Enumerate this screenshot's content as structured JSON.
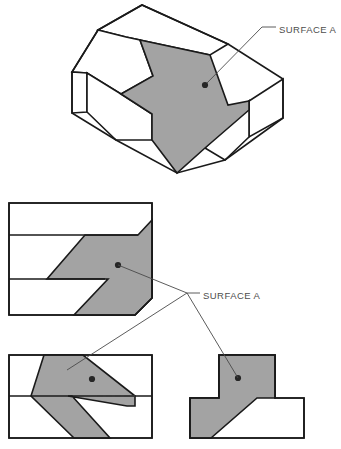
{
  "sheet": {
    "width": 341,
    "height": 449,
    "background": "#ffffff",
    "line_color": "#1a1a1a",
    "surface_fill": "#a3a3a3",
    "leader_color": "#4a4a4a",
    "text_color": "#4d4d4d"
  },
  "annotations": {
    "pictorial_label": "SURFACE A",
    "ortho_label": "SURFACE A"
  },
  "views": {
    "pictorial": {
      "name": "isometric-pictorial-view",
      "outline": "98,30 142,5 228,44 283,79 283,118 225,160 177,173 116,140 72,113 72,72",
      "top_rear_face": "98,30 142,5 228,44 210,55 140,40 126,37",
      "upper_top_face": "98,30 126,37 140,40 153,76 121,94 87,73 72,72",
      "step_left_face": "72,72 87,73 87,112 72,113",
      "step_front_face": "87,112 87,73 121,94 152,114 152,140 116,140",
      "right_side_face": "283,79 283,118 249,137 249,101",
      "lower_right_face": "249,101 249,137 225,160 205,148",
      "surface_a": "140,40 210,55 228,105 249,101 249,110 205,148 177,173 152,140 152,114 121,94 153,76",
      "surface_a_dot": {
        "x": 205,
        "y": 85
      }
    },
    "top_view": {
      "name": "top-orthographic-view",
      "outline": "9,203 152,203 152,298 135,315 9,315",
      "inner_lines": [
        "9,235 138,235",
        "9,279 105,279"
      ],
      "surface_a": "138,235 152,220 152,298 135,315 74,315 108,279 84,279 47,279 85,235",
      "surface_a_dot": {
        "x": 118,
        "y": 265
      }
    },
    "front_view": {
      "name": "front-orthographic-view",
      "outline": "9,355 152,355 152,438 9,438",
      "inner_lines": [
        "9,396 152,396"
      ],
      "hidden_line": "97,396 135,396",
      "surface_a": "44,355 83,355 135,396 135,406 127,406 68,396 72,396 110,438 74,438 31,396",
      "surface_a_dot": {
        "x": 92,
        "y": 379
      }
    },
    "right_view": {
      "name": "right-side-orthographic-view",
      "outline": "190,398 219,398 219,355 275,355 275,398 304,398 304,438 190,438",
      "surface_a": "219,355 275,355 275,398 257,398 211,438 190,438 190,398 219,398",
      "surface_a_dot": {
        "x": 238,
        "y": 378
      }
    }
  },
  "leaders": {
    "pictorial": {
      "path": "205,85 262,27 276,27",
      "label_x": 279,
      "label_y": 30
    },
    "ortho_hub": {
      "x": 187,
      "y": 293
    },
    "ortho": {
      "label_x": 203,
      "label_y": 296,
      "stub": "187,293 200,293",
      "branches": [
        "118,265 187,293",
        "187,293 67,370",
        "187,293 238,378"
      ]
    }
  }
}
